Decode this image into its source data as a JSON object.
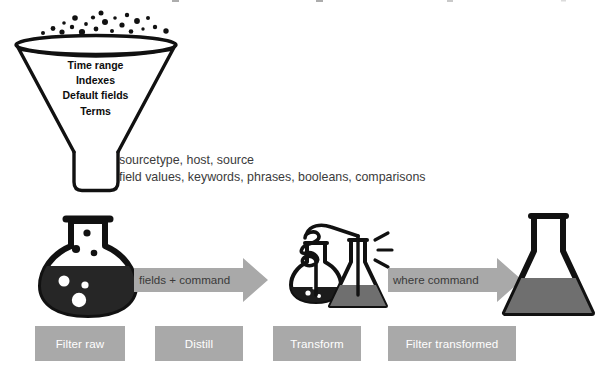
{
  "diagram": {
    "title_cropped": "",
    "funnel": {
      "name": "search-filter-funnel",
      "criteria": [
        "Time range",
        "Indexes",
        "Default fields",
        "Terms"
      ],
      "dots_above_count": 22
    },
    "criteria_detail": {
      "line1": "sourcetype, host, source",
      "line2": "field values, keywords, phrases, booleans, comparisons"
    },
    "arrows": [
      {
        "label": "fields + command"
      },
      {
        "label": "where command"
      }
    ],
    "stage_boxes": [
      {
        "label": "Filter raw"
      },
      {
        "label": "Distill"
      },
      {
        "label": "Transform"
      },
      {
        "label": "Filter transformed"
      }
    ],
    "vessels": [
      {
        "name": "round-flask-raw",
        "fill": "black",
        "bubbles": 3,
        "rising_dots": 3
      },
      {
        "name": "distillation-flask-small",
        "fill": "black"
      },
      {
        "name": "erlenmeyer-flask-middle",
        "fill": "gray"
      },
      {
        "name": "erlenmeyer-flask-large",
        "fill": "gray"
      }
    ],
    "colors": {
      "background": "#ffffff",
      "outline": "#111111",
      "box_gray": "#a9a9a9",
      "arrow_gray": "#a9a9a9",
      "liquid_dark": "#262626",
      "liquid_gray": "#6f6f6f",
      "body_text": "#3b3b3b",
      "box_text": "#ffffff"
    }
  }
}
